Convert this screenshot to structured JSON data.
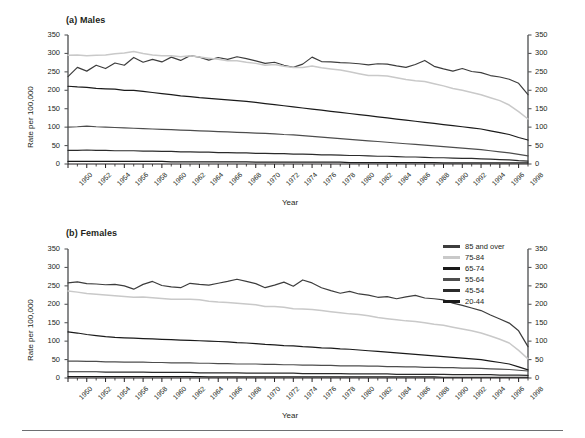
{
  "figure": {
    "panels": [
      {
        "id": "males",
        "title": "(a) Males"
      },
      {
        "id": "females",
        "title": "(b) Females"
      }
    ],
    "axis_titles": {
      "y": "Rate per 100,000",
      "x": "Year"
    }
  },
  "legend": {
    "position": "top-right of panel (b)",
    "entries": [
      {
        "label": "85 and over",
        "color": "#3d3d3d"
      },
      {
        "label": "75-84",
        "color": "#c9c9c9"
      },
      {
        "label": "65-74",
        "color": "#1a1a1a"
      },
      {
        "label": "55-64",
        "color": "#4d4d4d"
      },
      {
        "label": "45-54",
        "color": "#2b2b2b"
      },
      {
        "label": "20-44",
        "color": "#1a1a1a"
      }
    ]
  },
  "chart_data": [
    {
      "type": "line",
      "title": "(a) Males",
      "xlabel": "Year",
      "ylabel": "Rate per 100,000",
      "ylim": [
        0,
        350
      ],
      "ytick_labels": [
        "0",
        "50",
        "100",
        "150",
        "200",
        "250",
        "300",
        "350"
      ],
      "yticks": [
        0,
        50,
        100,
        150,
        200,
        250,
        300,
        350
      ],
      "xlim": [
        1950,
        1999
      ],
      "xtick_labels": [
        "1950",
        "1952",
        "1954",
        "1956",
        "1958",
        "1960",
        "1962",
        "1964",
        "1966",
        "1968",
        "1970",
        "1972",
        "1974",
        "1976",
        "1978",
        "1980",
        "1982",
        "1984",
        "1986",
        "1988",
        "1990",
        "1992",
        "1994",
        "1996",
        "1998"
      ],
      "grid": false,
      "dual_y_axis": true,
      "x": [
        1950,
        1951,
        1952,
        1953,
        1954,
        1955,
        1956,
        1957,
        1958,
        1959,
        1960,
        1961,
        1962,
        1963,
        1964,
        1965,
        1966,
        1967,
        1968,
        1969,
        1970,
        1971,
        1972,
        1973,
        1974,
        1975,
        1976,
        1977,
        1978,
        1979,
        1980,
        1981,
        1982,
        1983,
        1984,
        1985,
        1986,
        1987,
        1988,
        1989,
        1990,
        1991,
        1992,
        1993,
        1994,
        1995,
        1996,
        1997,
        1998,
        1999
      ],
      "series": [
        {
          "name": "85 and over",
          "color": "#3d3d3d",
          "values": [
            237,
            262,
            252,
            268,
            259,
            274,
            268,
            289,
            276,
            284,
            277,
            290,
            281,
            294,
            290,
            282,
            289,
            284,
            291,
            286,
            280,
            273,
            276,
            268,
            262,
            271,
            290,
            278,
            277,
            275,
            274,
            272,
            269,
            272,
            271,
            266,
            262,
            270,
            281,
            265,
            258,
            252,
            259,
            251,
            248,
            240,
            236,
            230,
            219,
            188
          ]
        },
        {
          "name": "75-84",
          "color": "#c9c9c9",
          "values": [
            295,
            296,
            294,
            295,
            296,
            299,
            301,
            305,
            300,
            296,
            294,
            294,
            291,
            294,
            290,
            287,
            284,
            280,
            280,
            276,
            273,
            268,
            270,
            265,
            262,
            262,
            266,
            261,
            258,
            255,
            250,
            245,
            240,
            240,
            239,
            234,
            229,
            226,
            224,
            218,
            212,
            205,
            200,
            194,
            188,
            180,
            172,
            160,
            142,
            122
          ]
        },
        {
          "name": "65-74",
          "color": "#1a1a1a",
          "values": [
            211,
            209,
            208,
            205,
            204,
            203,
            200,
            200,
            197,
            194,
            191,
            188,
            185,
            183,
            180,
            178,
            176,
            174,
            172,
            170,
            167,
            164,
            161,
            158,
            155,
            152,
            149,
            146,
            143,
            140,
            137,
            134,
            131,
            128,
            125,
            122,
            119,
            116,
            113,
            110,
            107,
            104,
            101,
            98,
            95,
            90,
            85,
            80,
            72,
            65
          ]
        },
        {
          "name": "55-64",
          "color": "#4d4d4d",
          "values": [
            100,
            101,
            103,
            101,
            100,
            99,
            98,
            97,
            96,
            95,
            94,
            93,
            92,
            91,
            90,
            89,
            88,
            87,
            86,
            85,
            84,
            83,
            82,
            80,
            79,
            77,
            75,
            73,
            71,
            69,
            67,
            65,
            63,
            61,
            59,
            57,
            55,
            53,
            51,
            49,
            47,
            45,
            43,
            41,
            39,
            36,
            33,
            30,
            26,
            22
          ]
        },
        {
          "name": "45-54",
          "color": "#2b2b2b",
          "values": [
            37,
            37,
            38,
            37,
            37,
            36,
            36,
            36,
            35,
            35,
            34,
            34,
            33,
            33,
            32,
            32,
            31,
            31,
            30,
            30,
            29,
            29,
            28,
            28,
            27,
            27,
            26,
            25,
            25,
            24,
            23,
            23,
            22,
            21,
            21,
            20,
            19,
            19,
            18,
            17,
            17,
            16,
            15,
            15,
            14,
            13,
            12,
            11,
            9,
            8
          ]
        },
        {
          "name": "20-44",
          "color": "#1a1a1a",
          "values": [
            7,
            7,
            7,
            7,
            7,
            7,
            7,
            7,
            7,
            7,
            7,
            6,
            6,
            6,
            6,
            6,
            6,
            6,
            6,
            6,
            5,
            5,
            5,
            5,
            5,
            5,
            5,
            5,
            5,
            5,
            4,
            4,
            4,
            4,
            4,
            4,
            4,
            4,
            4,
            4,
            3,
            3,
            3,
            3,
            3,
            3,
            3,
            3,
            3,
            3
          ]
        }
      ]
    },
    {
      "type": "line",
      "title": "(b) Females",
      "xlabel": "Year",
      "ylabel": "Rate per 100,000",
      "ylim": [
        0,
        350
      ],
      "ytick_labels": [
        "0",
        "50",
        "100",
        "150",
        "200",
        "250",
        "300",
        "350"
      ],
      "yticks": [
        0,
        50,
        100,
        150,
        200,
        250,
        300,
        350
      ],
      "xlim": [
        1950,
        1999
      ],
      "xtick_labels": [
        "1950",
        "1952",
        "1954",
        "1956",
        "1958",
        "1960",
        "1962",
        "1964",
        "1966",
        "1968",
        "1970",
        "1972",
        "1974",
        "1976",
        "1978",
        "1980",
        "1982",
        "1984",
        "1986",
        "1988",
        "1990",
        "1992",
        "1994",
        "1996",
        "1998"
      ],
      "grid": false,
      "dual_y_axis": true,
      "x": [
        1950,
        1951,
        1952,
        1953,
        1954,
        1955,
        1956,
        1957,
        1958,
        1959,
        1960,
        1961,
        1962,
        1963,
        1964,
        1965,
        1966,
        1967,
        1968,
        1969,
        1970,
        1971,
        1972,
        1973,
        1974,
        1975,
        1976,
        1977,
        1978,
        1979,
        1980,
        1981,
        1982,
        1983,
        1984,
        1985,
        1986,
        1987,
        1988,
        1989,
        1990,
        1991,
        1992,
        1993,
        1994,
        1995,
        1996,
        1997,
        1998,
        1999
      ],
      "series": [
        {
          "name": "85 and over",
          "color": "#3d3d3d",
          "values": [
            258,
            261,
            256,
            255,
            253,
            254,
            250,
            241,
            254,
            262,
            251,
            247,
            245,
            257,
            254,
            252,
            257,
            262,
            268,
            262,
            256,
            245,
            252,
            260,
            249,
            266,
            258,
            245,
            237,
            230,
            235,
            228,
            225,
            219,
            221,
            215,
            220,
            224,
            217,
            215,
            212,
            203,
            197,
            190,
            183,
            171,
            160,
            149,
            128,
            85
          ]
        },
        {
          "name": "75-84",
          "color": "#c9c9c9",
          "values": [
            236,
            233,
            229,
            227,
            225,
            223,
            221,
            219,
            220,
            218,
            216,
            214,
            214,
            214,
            212,
            208,
            206,
            205,
            203,
            201,
            199,
            194,
            194,
            192,
            188,
            187,
            186,
            183,
            180,
            177,
            174,
            172,
            169,
            164,
            161,
            158,
            155,
            153,
            150,
            146,
            143,
            138,
            133,
            128,
            122,
            114,
            105,
            95,
            75,
            52
          ]
        },
        {
          "name": "65-74",
          "color": "#1a1a1a",
          "values": [
            125,
            122,
            118,
            115,
            112,
            110,
            109,
            108,
            107,
            106,
            105,
            104,
            103,
            102,
            101,
            100,
            99,
            98,
            96,
            95,
            93,
            91,
            90,
            88,
            87,
            85,
            84,
            82,
            81,
            79,
            78,
            76,
            74,
            72,
            70,
            68,
            66,
            64,
            62,
            60,
            58,
            56,
            54,
            52,
            50,
            46,
            42,
            38,
            30,
            22
          ]
        },
        {
          "name": "55-64",
          "color": "#4d4d4d",
          "values": [
            46,
            46,
            45,
            45,
            44,
            44,
            43,
            43,
            43,
            42,
            42,
            41,
            41,
            41,
            40,
            40,
            39,
            39,
            38,
            38,
            38,
            37,
            37,
            36,
            36,
            35,
            35,
            34,
            34,
            33,
            33,
            33,
            32,
            32,
            31,
            31,
            30,
            30,
            29,
            29,
            28,
            28,
            27,
            27,
            26,
            25,
            24,
            23,
            21,
            19
          ]
        },
        {
          "name": "45-54",
          "color": "#2b2b2b",
          "values": [
            17,
            17,
            17,
            17,
            16,
            16,
            16,
            16,
            16,
            15,
            15,
            15,
            15,
            15,
            14,
            14,
            14,
            14,
            14,
            13,
            13,
            13,
            13,
            13,
            13,
            12,
            12,
            12,
            12,
            12,
            11,
            11,
            11,
            11,
            11,
            10,
            10,
            10,
            10,
            10,
            10,
            9,
            9,
            9,
            9,
            9,
            8,
            8,
            8,
            7
          ]
        },
        {
          "name": "20-44",
          "color": "#1a1a1a",
          "values": [
            4,
            4,
            4,
            4,
            4,
            4,
            4,
            4,
            4,
            4,
            4,
            4,
            4,
            4,
            4,
            3,
            3,
            3,
            3,
            3,
            3,
            3,
            3,
            3,
            3,
            3,
            3,
            3,
            3,
            3,
            3,
            3,
            3,
            3,
            3,
            3,
            3,
            3,
            3,
            3,
            2,
            2,
            2,
            2,
            2,
            2,
            2,
            2,
            2,
            2
          ]
        }
      ]
    }
  ]
}
